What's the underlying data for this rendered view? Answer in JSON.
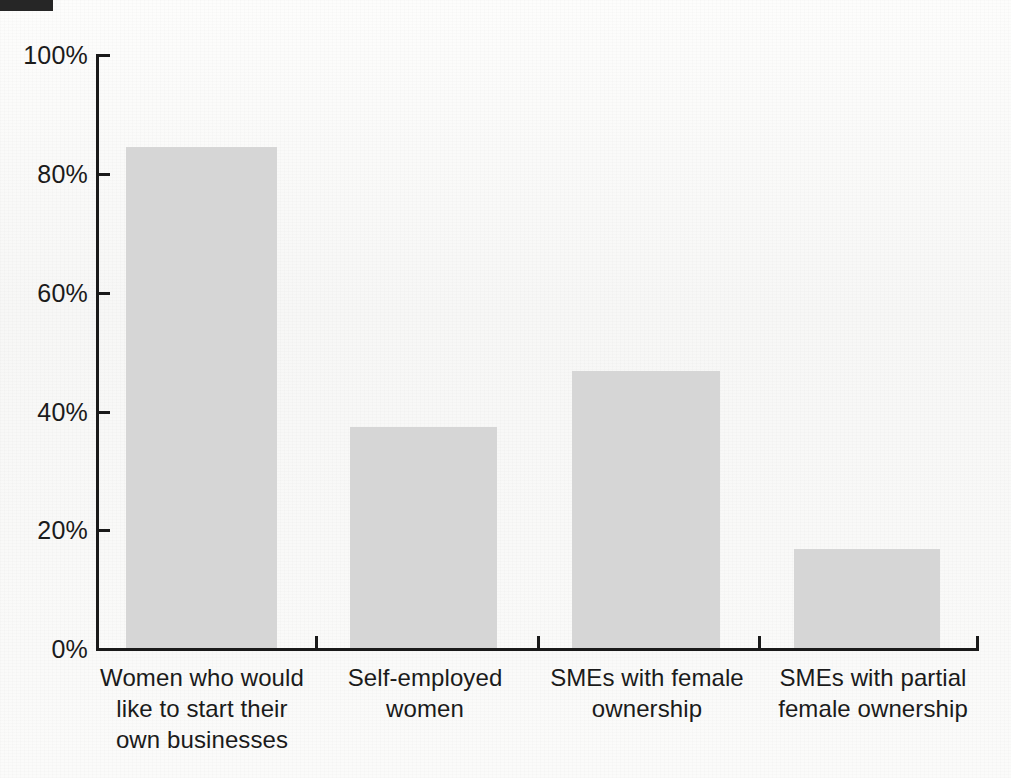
{
  "figure": {
    "background_color": "#fbfbfa",
    "bar_color": "#d6d6d6",
    "axis_color": "#1a1a1a",
    "text_color": "#1b1b1b",
    "corner_block_color": "#262626"
  },
  "chart_data": {
    "type": "bar",
    "title": "",
    "subtitle": "",
    "xlabel": "",
    "ylabel": "",
    "ylim": [
      0,
      100
    ],
    "yticks": [
      0,
      20,
      40,
      60,
      80,
      100
    ],
    "ytick_labels": [
      "0%",
      "20%",
      "40%",
      "60%",
      "80%",
      "100%"
    ],
    "grid": false,
    "legend": false,
    "legend_position": "none",
    "value_labels_shown": false,
    "categories": [
      "Women who would like to start their own businesses",
      "Self-employed women",
      "SMEs with female ownership",
      "SMEs with partial female ownership"
    ],
    "category_label_lines": [
      [
        "Women who would",
        "like to start their",
        "own businesses"
      ],
      [
        "Self-employed",
        "women"
      ],
      [
        "SMEs with female",
        "ownership"
      ],
      [
        "SMEs with partial",
        "female ownership"
      ]
    ],
    "values": [
      84.5,
      37.3,
      46.7,
      16.7
    ],
    "series": [
      {
        "name": "Share",
        "values": [
          84.5,
          37.3,
          46.7,
          16.7
        ]
      }
    ]
  }
}
